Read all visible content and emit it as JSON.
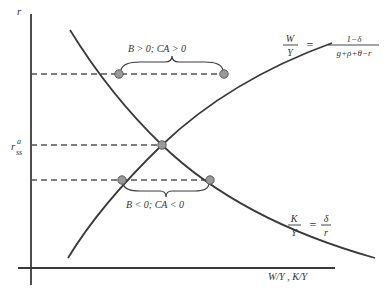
{
  "diagram": {
    "axes": {
      "y_label": "r",
      "x_label": "W/Y , K/Y",
      "tick_label_base": "r",
      "tick_label_sup": "a",
      "tick_label_sub": "ss"
    },
    "curves": {
      "wealth": {
        "lhs_num": "W",
        "lhs_den": "Y",
        "eq": "=",
        "rhs_num": "1−δ",
        "rhs_den": "g+ρ+θ−r"
      },
      "capital": {
        "lhs_num": "K",
        "lhs_den": "Y",
        "eq": "=",
        "rhs_num": "δ",
        "rhs_den": "r"
      }
    },
    "annotations": {
      "upper": "B > 0; CA > 0",
      "lower": "B < 0; CA < 0"
    },
    "colors": {
      "line": "#3a3a3a",
      "point_fill": "#9a9a9a",
      "point_stroke": "#5a5a5a",
      "text": "#333333"
    }
  }
}
